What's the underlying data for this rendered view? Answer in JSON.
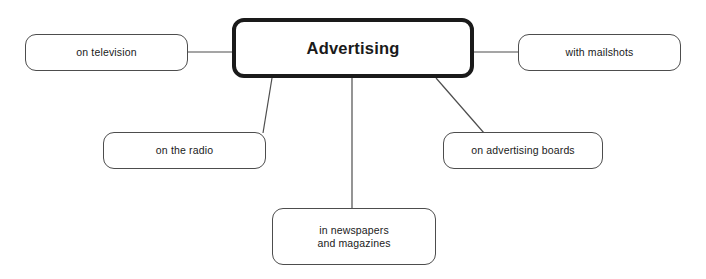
{
  "diagram": {
    "type": "mind-map",
    "title": "Advertising",
    "background_color": "#ffffff",
    "central": {
      "label": "Advertising",
      "border_color": "#1a1a1a",
      "fill_color": "#ffffff",
      "x": 232,
      "y": 18,
      "width": 242,
      "height": 60
    },
    "branches": [
      {
        "name": "on-television",
        "label": "on television",
        "x": 25,
        "y": 34,
        "width": 163,
        "height": 37,
        "border_color": "#4d4d4d"
      },
      {
        "name": "with-mailshots",
        "label": "with mailshots",
        "x": 518,
        "y": 34,
        "width": 163,
        "height": 37,
        "border_color": "#4d4d4d"
      },
      {
        "name": "on-the-radio",
        "label": "on the radio",
        "x": 103,
        "y": 132,
        "width": 163,
        "height": 37,
        "border_color": "#4d4d4d"
      },
      {
        "name": "on-advertising-boards",
        "label": "on advertising boards",
        "x": 443,
        "y": 132,
        "width": 160,
        "height": 37,
        "border_color": "#4d4d4d"
      },
      {
        "name": "in-newspapers-and-magazines",
        "label": "in newspapers\nand magazines",
        "x": 272,
        "y": 208,
        "width": 164,
        "height": 57,
        "border_color": "#4d4d4d"
      }
    ],
    "connectors": [
      {
        "name": "connector-television",
        "x1": 188,
        "y1": 52,
        "x2": 232,
        "y2": 52,
        "color": "#4d4d4d"
      },
      {
        "name": "connector-mailshots",
        "x1": 474,
        "y1": 52,
        "x2": 518,
        "y2": 52,
        "color": "#4d4d4d"
      },
      {
        "name": "connector-radio",
        "x1": 272,
        "y1": 78,
        "x2": 263,
        "y2": 133,
        "color": "#4d4d4d"
      },
      {
        "name": "connector-boards",
        "x1": 436,
        "y1": 78,
        "x2": 484,
        "y2": 133,
        "color": "#4d4d4d"
      },
      {
        "name": "connector-newspapers",
        "x1": 352,
        "y1": 78,
        "x2": 352,
        "y2": 208,
        "color": "#4d4d4d"
      }
    ]
  }
}
